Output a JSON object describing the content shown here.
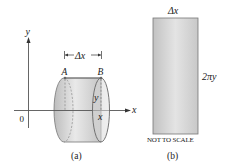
{
  "figure_a": {
    "caption": "(a)",
    "axis_y_label": "y",
    "axis_x_label": "x",
    "origin_label": "0",
    "point_a_label": "A",
    "point_b_label": "B",
    "delta_label": "Δx",
    "radius_label": "y",
    "position_label": "x"
  },
  "figure_b": {
    "caption": "(b)",
    "width_label": "Δx",
    "height_label": "2πy",
    "note": "NOT TO SCALE"
  },
  "colors": {
    "shape_fill_light": "#e6e6e6",
    "shape_fill_dark": "#b8b8b8",
    "stroke": "#6a6a6a",
    "text": "#222222"
  }
}
